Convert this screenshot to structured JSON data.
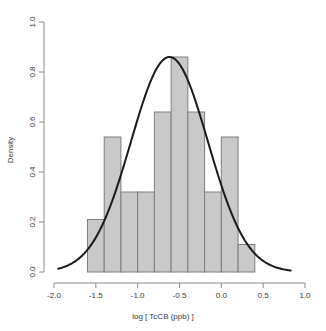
{
  "chart_data": {
    "type": "bar",
    "title": "",
    "subtitle": "",
    "xlabel": "log [ TcCB (ppb) ]",
    "ylabel": "Density",
    "xlim": [
      -2.0,
      1.0
    ],
    "ylim": [
      0.0,
      1.0
    ],
    "grid": false,
    "legend": null,
    "bin_width": 0.2,
    "bin_edges": [
      -1.6,
      -1.4,
      -1.2,
      -1.0,
      -0.8,
      -0.6,
      -0.4,
      -0.2,
      0.0,
      0.2,
      0.4
    ],
    "categories": [
      "-1.6",
      "-1.4",
      "-1.2",
      "-1.0",
      "-0.8",
      "-0.6",
      "-0.4",
      "-0.2",
      "0.0",
      "0.2"
    ],
    "values": [
      0.21,
      0.54,
      0.32,
      0.32,
      0.64,
      0.86,
      0.64,
      0.32,
      0.54,
      0.11
    ],
    "xticks": [
      -2.0,
      -1.5,
      -1.0,
      -0.5,
      0.0,
      0.5,
      1.0
    ],
    "xtick_labels": [
      "-2.0",
      "-1.5",
      "-1.0",
      "-0.5",
      "0.0",
      "0.5",
      "1.0"
    ],
    "yticks": [
      0.0,
      0.2,
      0.4,
      0.6,
      0.8,
      1.0
    ],
    "ytick_labels": [
      "0.0",
      "0.2",
      "0.4",
      "0.6",
      "0.8",
      "1.0"
    ],
    "overlay": {
      "type": "line",
      "name": "normal-density-curve",
      "distribution": "normal",
      "mean": -0.62,
      "sd": 0.46,
      "peak": 0.86,
      "color": "#1a1a1a"
    },
    "colors": {
      "bar_fill": "#c9c9c9",
      "bar_stroke": "#7d7d7d",
      "curve": "#1a1a1a",
      "axis": "#8a8a8a",
      "text": "#3a3a3a",
      "background": "#ffffff"
    }
  }
}
